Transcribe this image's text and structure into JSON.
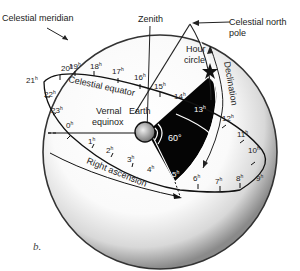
{
  "figure": {
    "caption": "b.",
    "labels": {
      "celestial_meridian": "Celestial meridian",
      "zenith": "Zenith",
      "celestial_north_pole_1": "Celestial north",
      "celestial_north_pole_2": "pole",
      "hour_circle_1": "Hour",
      "hour_circle_2": "circle",
      "declination": "Declination",
      "celestial_equator": "Celestial equator",
      "vernal_equinox_1": "Vernal",
      "vernal_equinox_2": "equinox",
      "earth": "Earth",
      "angle": "60°",
      "right_ascension": "Right ascension"
    },
    "hour_marks": {
      "h0": "0",
      "h1": "1",
      "h2": "2",
      "h3": "3",
      "h4": "4",
      "h5": "5",
      "h6": "6",
      "h7": "7",
      "h8": "8",
      "h9": "9",
      "h10": "10",
      "h11": "11",
      "h12": "12",
      "h13": "13",
      "h14": "14",
      "h15": "15",
      "h16": "16",
      "h17": "17",
      "h18": "18",
      "h19": "19",
      "h20": "20",
      "h21": "21",
      "h22": "22",
      "h23": "23"
    },
    "hour_suffix": "h",
    "icons": {
      "star": "star-icon",
      "earth": "earth-icon"
    }
  }
}
